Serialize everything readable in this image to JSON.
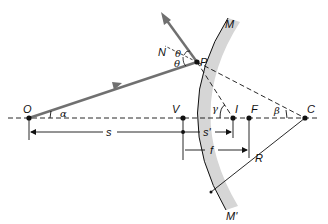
{
  "diagram": {
    "type": "concave-mirror-ray-geometry",
    "colors": {
      "background": "#ffffff",
      "ray": "#707070",
      "mirror_fill": "#d6d6d6",
      "line": "#111111"
    },
    "points": {
      "O": "O",
      "V": "V",
      "I": "I",
      "F": "F",
      "C": "C",
      "P": "P"
    },
    "mirror_labels": {
      "top": "M",
      "bottom": "M'"
    },
    "normal_label": "N",
    "angles": {
      "alpha": "α",
      "beta": "β",
      "gamma": "γ",
      "theta_incident": "θ",
      "theta_reflected": "θ"
    },
    "distances": {
      "object": "s",
      "image": "s'",
      "focal": "f",
      "radius": "R"
    }
  }
}
